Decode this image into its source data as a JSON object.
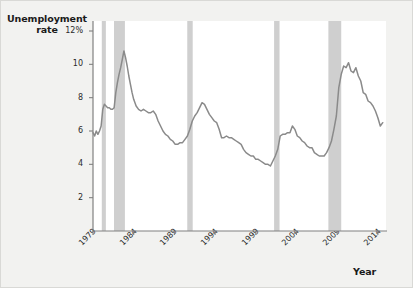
{
  "figure": {
    "background_color": "#f2f2f0",
    "plot_background_color": "#ffffff",
    "border_color": "#d9d9d6"
  },
  "chart_data": {
    "type": "line",
    "title": "",
    "ylabel": "Unemployment rate",
    "xlabel": "Year",
    "ylabel_line1": "Unemployment",
    "ylabel_line2": "rate",
    "line_color": "#8a8a8a",
    "recession_band_color": "#cfcfcf",
    "axis_color": "#808080",
    "grid": false,
    "legend": null,
    "xlim": [
      1979,
      2015
    ],
    "ylim": [
      0,
      12.6
    ],
    "ytick_values": [
      2,
      4,
      6,
      8,
      10,
      12
    ],
    "ytick_labels": [
      "2",
      "4",
      "6",
      "8",
      "10",
      "12%"
    ],
    "xtick_values": [
      1979,
      1984,
      1989,
      1994,
      1999,
      2004,
      2009,
      2014
    ],
    "xtick_labels": [
      "1979",
      "1984",
      "1989",
      "1994",
      "1999",
      "2004",
      "2009",
      "2014"
    ],
    "recession_bands": [
      {
        "label": "1980 recession",
        "start": 1980.08,
        "end": 1980.58
      },
      {
        "label": "1981-82 recession",
        "start": 1981.58,
        "end": 1982.92
      },
      {
        "label": "1990-91 recession",
        "start": 1990.58,
        "end": 1991.25
      },
      {
        "label": "2001 recession",
        "start": 2001.25,
        "end": 2001.92
      },
      {
        "label": "2007-09 recession",
        "start": 2007.92,
        "end": 2009.5
      }
    ],
    "series": [
      {
        "name": "Unemployment rate",
        "x": [
          1979.0,
          1979.2,
          1979.4,
          1979.6,
          1979.8,
          1980.0,
          1980.2,
          1980.4,
          1980.6,
          1980.8,
          1981.0,
          1981.2,
          1981.4,
          1981.6,
          1981.8,
          1982.0,
          1982.2,
          1982.4,
          1982.6,
          1982.8,
          1983.0,
          1983.2,
          1983.4,
          1983.6,
          1983.8,
          1984.0,
          1984.3,
          1984.6,
          1984.9,
          1985.2,
          1985.5,
          1985.8,
          1986.1,
          1986.4,
          1986.7,
          1987.0,
          1987.3,
          1987.6,
          1987.9,
          1988.2,
          1988.5,
          1988.8,
          1989.1,
          1989.4,
          1989.7,
          1990.0,
          1990.3,
          1990.6,
          1990.9,
          1991.2,
          1991.5,
          1991.8,
          1992.1,
          1992.4,
          1992.7,
          1993.0,
          1993.3,
          1993.6,
          1993.9,
          1994.2,
          1994.5,
          1994.8,
          1995.1,
          1995.4,
          1995.7,
          1996.0,
          1996.3,
          1996.6,
          1996.9,
          1997.2,
          1997.5,
          1997.8,
          1998.1,
          1998.4,
          1998.7,
          1999.0,
          1999.3,
          1999.6,
          1999.9,
          2000.2,
          2000.5,
          2000.8,
          2001.1,
          2001.4,
          2001.7,
          2002.0,
          2002.3,
          2002.6,
          2002.9,
          2003.2,
          2003.5,
          2003.8,
          2004.1,
          2004.4,
          2004.7,
          2005.0,
          2005.3,
          2005.6,
          2005.9,
          2006.2,
          2006.5,
          2006.8,
          2007.1,
          2007.4,
          2007.7,
          2008.0,
          2008.3,
          2008.6,
          2008.9,
          2009.2,
          2009.5,
          2009.8,
          2010.1,
          2010.4,
          2010.7,
          2011.0,
          2011.3,
          2011.6,
          2011.9,
          2012.2,
          2012.5,
          2012.8,
          2013.1,
          2013.4,
          2013.7,
          2014.0,
          2014.3,
          2014.6
        ],
        "values": [
          5.9,
          5.7,
          6.0,
          5.8,
          6.0,
          6.3,
          7.3,
          7.6,
          7.5,
          7.4,
          7.4,
          7.3,
          7.3,
          7.4,
          8.3,
          8.9,
          9.4,
          9.8,
          10.3,
          10.8,
          10.4,
          9.9,
          9.3,
          8.8,
          8.3,
          7.9,
          7.5,
          7.3,
          7.2,
          7.3,
          7.2,
          7.1,
          7.1,
          7.2,
          7.0,
          6.6,
          6.3,
          6.0,
          5.8,
          5.7,
          5.5,
          5.4,
          5.2,
          5.2,
          5.3,
          5.3,
          5.5,
          5.7,
          6.1,
          6.6,
          6.9,
          7.1,
          7.4,
          7.7,
          7.6,
          7.3,
          7.0,
          6.8,
          6.6,
          6.5,
          6.1,
          5.6,
          5.6,
          5.7,
          5.6,
          5.6,
          5.5,
          5.4,
          5.3,
          5.2,
          4.9,
          4.7,
          4.6,
          4.5,
          4.5,
          4.3,
          4.3,
          4.2,
          4.1,
          4.0,
          4.0,
          3.9,
          4.2,
          4.5,
          4.9,
          5.7,
          5.8,
          5.8,
          5.9,
          5.9,
          6.3,
          6.1,
          5.7,
          5.6,
          5.4,
          5.3,
          5.1,
          5.0,
          5.0,
          4.7,
          4.6,
          4.5,
          4.5,
          4.5,
          4.7,
          5.0,
          5.4,
          6.1,
          6.9,
          8.6,
          9.4,
          9.9,
          9.8,
          10.1,
          9.6,
          9.5,
          9.8,
          9.3,
          9.0,
          8.3,
          8.2,
          7.8,
          7.7,
          7.5,
          7.2,
          6.8,
          6.3,
          6.5
        ]
      }
    ]
  },
  "ticks": {
    "y_positions_px": [
      207,
      172,
      137,
      102,
      67,
      66
    ],
    "x_positions_px": [
      92,
      134,
      176,
      218,
      260,
      302,
      344,
      386
    ]
  }
}
